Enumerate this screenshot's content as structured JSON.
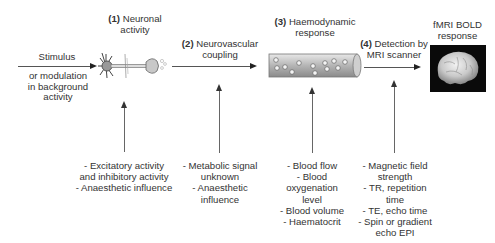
{
  "diagram": {
    "stages": [
      {
        "num": "(1)",
        "label": "Neuronal",
        "label2": "activity"
      },
      {
        "num": "(2)",
        "label": "Neurovascular",
        "label2": "coupling"
      },
      {
        "num": "(3)",
        "label": "Haemodynamic",
        "label2": "response"
      },
      {
        "num": "(4)",
        "label": "Detection by",
        "label2": "MRI scanner"
      }
    ],
    "input": {
      "label": "Stimulus",
      "sublabel": [
        "or modulation",
        "in background",
        "activity"
      ]
    },
    "output": {
      "label": "fMRI BOLD",
      "label2": "response"
    },
    "icons": {
      "neuron": "neuron-illustration",
      "vessel": "blood-vessel-illustration",
      "brain": "brain-fmri-image"
    },
    "factors": [
      {
        "stage": 1,
        "lines": [
          "- Excitatory activity",
          "and inhibitory activity",
          "- Anaesthetic influence"
        ]
      },
      {
        "stage": 2,
        "lines": [
          "- Metabolic signal",
          "unknown",
          "- Anaesthetic",
          "influence"
        ]
      },
      {
        "stage": 3,
        "lines": [
          "- Blood flow",
          "- Blood",
          "oxygenation",
          "level",
          "- Blood volume",
          "- Haematocrit"
        ]
      },
      {
        "stage": 4,
        "lines": [
          "- Magnetic field",
          "strength",
          "- TR, repetition",
          "time",
          "- TE, echo time",
          "- Spin or gradient",
          "echo EPI"
        ]
      }
    ],
    "colors": {
      "text": "#333333",
      "arrow": "#222222",
      "vessel": "#b8b8b8",
      "brain_bg": "#0a0a0a"
    }
  }
}
